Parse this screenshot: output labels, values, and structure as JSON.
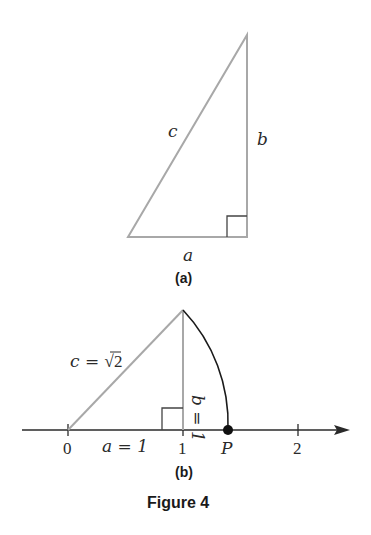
{
  "figure": {
    "caption": "Figure 4",
    "colors": {
      "triangle_stroke": "#a8a8a8",
      "axis_stroke": "#2a2a2a",
      "arc_stroke": "#1a1a1a",
      "point_fill": "#111111"
    }
  },
  "panel_a": {
    "label": "(a)",
    "sides": {
      "hypotenuse": "c",
      "vertical": "b",
      "base": "a"
    },
    "right_angle_marker": true
  },
  "panel_b": {
    "label": "(b)",
    "hypotenuse_label_lhs": "c = ",
    "hypotenuse_label_radical": "√",
    "hypotenuse_label_radicand": "2",
    "vertical_label": "b = 1",
    "base_label": "a = 1",
    "number_line": {
      "ticks": [
        {
          "value": 0,
          "label": "0"
        },
        {
          "value": 1,
          "label": "1"
        },
        {
          "value": 2,
          "label": "2"
        }
      ],
      "point": {
        "label": "P",
        "value": "√2"
      }
    },
    "right_angle_marker": true
  }
}
